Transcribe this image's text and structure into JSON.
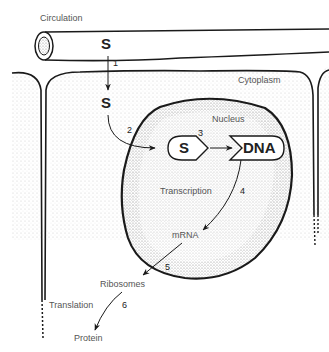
{
  "labels": {
    "circulation": "Circulation",
    "cytoplasm": "Cytoplasm",
    "nucleus": "Nucleus",
    "transcription": "Transcription",
    "mrna": "mRNA",
    "ribosomes": "Ribosomes",
    "translation": "Translation",
    "protein": "Protein",
    "s_circulation": "S",
    "s_cytoplasm": "S",
    "s_receptor": "S",
    "dna": "DNA"
  },
  "steps": [
    "1",
    "2",
    "3",
    "4",
    "5",
    "6"
  ],
  "colors": {
    "line": "#1a1a1a",
    "stipple": "#bdbdbd",
    "text": "#555555"
  }
}
